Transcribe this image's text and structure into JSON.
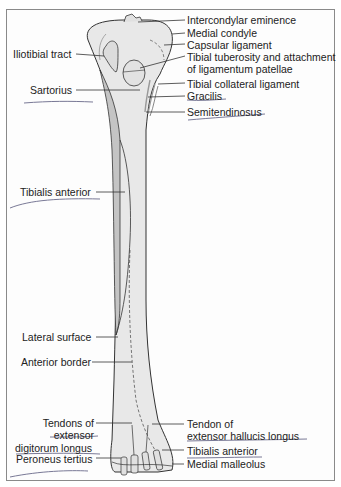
{
  "figure": {
    "colors": {
      "bone_fill": "#e8e8e8",
      "bone_shade": "#c4c4c4",
      "outline": "#333333",
      "leader": "#333333",
      "pen_underline": "#6a6a8a",
      "frame": "#8a8a8a"
    },
    "labels_right": [
      {
        "id": "intercondylar-eminence",
        "text": "Intercondylar eminence"
      },
      {
        "id": "medial-condyle",
        "text": "Medial condyle"
      },
      {
        "id": "capsular-ligament",
        "text": "Capsular ligament"
      },
      {
        "id": "tibial-tuberosity",
        "text": "Tibial tuberosity and attachment",
        "text2": "of ligamentum patellae"
      },
      {
        "id": "tibial-collateral-ligament",
        "text": "Tibial collateral ligament"
      },
      {
        "id": "gracilis",
        "text": "Gracilis"
      },
      {
        "id": "semitendinosus",
        "text": "Semitendinosus"
      },
      {
        "id": "tendon-ehl",
        "text": "Tendon of",
        "text2": "extensor hallucis longus"
      },
      {
        "id": "tibialis-anterior-tendon",
        "text": "Tibialis anterior"
      },
      {
        "id": "medial-malleolus",
        "text": "Medial malleolus"
      }
    ],
    "labels_left": [
      {
        "id": "iliotibial-tract",
        "text": "Iliotibial tract"
      },
      {
        "id": "sartorius",
        "text": "Sartorius"
      },
      {
        "id": "tibialis-anterior",
        "text": "Tibialis anterior"
      },
      {
        "id": "lateral-surface",
        "text": "Lateral surface"
      },
      {
        "id": "anterior-border",
        "text": "Anterior border"
      },
      {
        "id": "tendons-edl",
        "text": "Tendons of",
        "text2": "extensor",
        "text3": "digitorum longus"
      },
      {
        "id": "peroneus-tertius",
        "text": "Peroneus tertius"
      }
    ]
  }
}
